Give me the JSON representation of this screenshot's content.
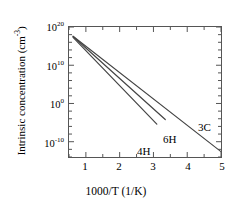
{
  "figure": {
    "background": "#ffffff",
    "line_color": "#444444",
    "axis_color": "#555555"
  },
  "chart_data": {
    "type": "line",
    "title": "",
    "xlabel": "1000/T (1/K)",
    "ylabel": "Intrinsic concentration (cm",
    "ylabel_sup": "-3",
    "ylabel_tail": ")",
    "xlim": [
      0.5,
      5.0
    ],
    "ylim_log10": [
      -14,
      20
    ],
    "grid": false,
    "legend": "inline-annotations",
    "xticks": [
      {
        "value": 1,
        "label": "1"
      },
      {
        "value": 2,
        "label": "2"
      },
      {
        "value": 3,
        "label": "3"
      },
      {
        "value": 4,
        "label": "4"
      },
      {
        "value": 5,
        "label": "5"
      }
    ],
    "xminor_ticks": [
      0.5,
      1.5,
      2.5,
      3.5,
      4.5
    ],
    "yticks": [
      {
        "log10": 20,
        "mantissa": "10",
        "exponent": "20"
      },
      {
        "log10": 10,
        "mantissa": "10",
        "exponent": "10"
      },
      {
        "log10": 0,
        "mantissa": "10",
        "exponent": "0"
      },
      {
        "log10": -10,
        "mantissa": "10",
        "exponent": "-10"
      }
    ],
    "series": [
      {
        "name": "3C",
        "label": "3C",
        "points": [
          [
            0.62,
            17.6
          ],
          [
            5.0,
            -12.6
          ]
        ]
      },
      {
        "name": "6H",
        "label": "6H",
        "points": [
          [
            0.62,
            17.5
          ],
          [
            3.35,
            -4.2
          ]
        ]
      },
      {
        "name": "4H",
        "label": "4H",
        "points": [
          [
            0.62,
            17.3
          ],
          [
            3.1,
            -5.4
          ]
        ]
      }
    ],
    "annotations": [
      {
        "text": "3C",
        "x_px": 198,
        "y_px": 122
      },
      {
        "text": "6H",
        "x_px": 163,
        "y_px": 134
      },
      {
        "text": "4H",
        "x_px": 137,
        "y_px": 146
      }
    ]
  }
}
